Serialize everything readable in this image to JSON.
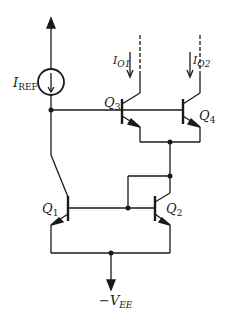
{
  "diagram": {
    "title": "",
    "type": "BJT current mirror (cascode / Wilson-style)",
    "colors": {
      "stroke": "#1a1a1a",
      "background": "#ffffff"
    },
    "labels": {
      "iref": {
        "main": "I",
        "sub": "REF"
      },
      "io1": {
        "main": "I",
        "sub": "O1"
      },
      "io2": {
        "main": "I",
        "sub": "O2"
      },
      "q1": {
        "main": "Q",
        "sub": "1"
      },
      "q2": {
        "main": "Q",
        "sub": "2"
      },
      "q3": {
        "main": "Q",
        "sub": "3"
      },
      "q4": {
        "main": "Q",
        "sub": "4"
      },
      "vee": {
        "main": "−V",
        "sub": "EE"
      }
    },
    "components": [
      {
        "id": "IREF",
        "kind": "current-source"
      },
      {
        "id": "Q1",
        "kind": "npn-transistor"
      },
      {
        "id": "Q2",
        "kind": "npn-transistor"
      },
      {
        "id": "Q3",
        "kind": "npn-transistor"
      },
      {
        "id": "Q4",
        "kind": "npn-transistor"
      }
    ]
  }
}
